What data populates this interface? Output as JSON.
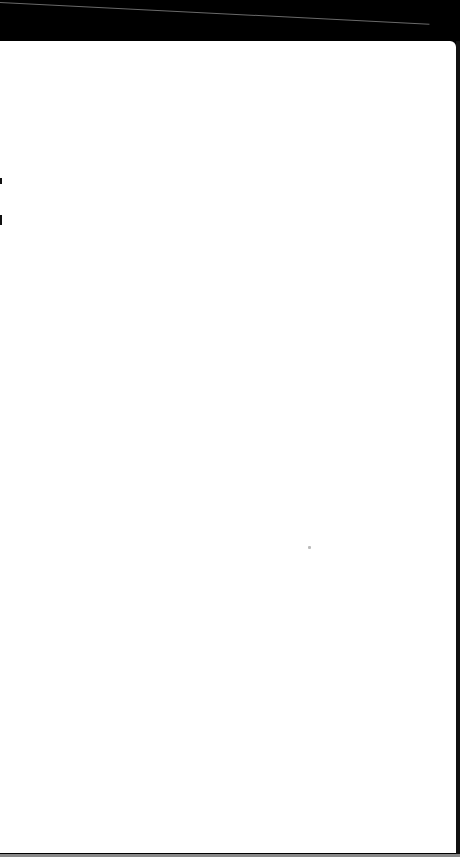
{
  "screen": {
    "state": "blank",
    "background_color": "#ffffff",
    "frame_color": "#000000"
  }
}
